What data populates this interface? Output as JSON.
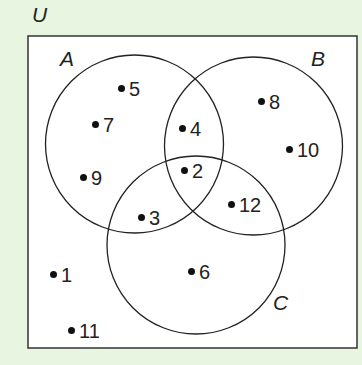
{
  "diagram": {
    "type": "venn",
    "universe_label": "U",
    "sets": [
      {
        "label": "A",
        "cx": 134.5,
        "cy": 144,
        "r": 89
      },
      {
        "label": "B",
        "cx": 253.5,
        "cy": 146,
        "r": 89
      },
      {
        "label": "C",
        "cx": 196,
        "cy": 245,
        "r": 89
      }
    ],
    "elements": [
      {
        "value": "5",
        "x": 118,
        "y": 79,
        "region": "A only"
      },
      {
        "value": "7",
        "x": 92,
        "y": 115,
        "region": "A only"
      },
      {
        "value": "9",
        "x": 80,
        "y": 168,
        "region": "A only"
      },
      {
        "value": "4",
        "x": 179,
        "y": 119,
        "region": "A and B only"
      },
      {
        "value": "2",
        "x": 181,
        "y": 161,
        "region": "A, B and C"
      },
      {
        "value": "3",
        "x": 138,
        "y": 208,
        "region": "A and C only"
      },
      {
        "value": "8",
        "x": 258,
        "y": 92,
        "region": "B only"
      },
      {
        "value": "10",
        "x": 286,
        "y": 140,
        "region": "B only"
      },
      {
        "value": "12",
        "x": 228,
        "y": 195,
        "region": "B and C only"
      },
      {
        "value": "6",
        "x": 188,
        "y": 262,
        "region": "C only"
      },
      {
        "value": "1",
        "x": 50,
        "y": 265,
        "region": "outside"
      },
      {
        "value": "11",
        "x": 68,
        "y": 321,
        "region": "outside"
      }
    ],
    "colors": {
      "background": "#e8f5e1",
      "box": "#ffffff",
      "stroke": "#222222"
    }
  }
}
